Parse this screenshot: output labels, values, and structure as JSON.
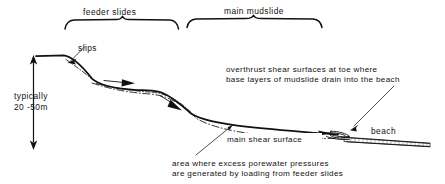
{
  "figure": {
    "title_top_left": "feeder slides",
    "title_top_right": "main mudslide",
    "scale_label_line1": "typically",
    "scale_label_line2": "20 -50m",
    "label_slips": "slips",
    "label_beach": "beach",
    "label_main_shear_surface": "main shear surface",
    "annotation_overthrust_line1": "overthrust shear surfaces at toe where",
    "annotation_overthrust_line2": "base layers of mudslide drain into the beach",
    "annotation_porewater_line1": "area where excess porewater pressures",
    "annotation_porewater_line2": "are generated by loading from feeder slides"
  },
  "colors": {
    "ink": "#111111",
    "paper": "#ffffff"
  },
  "icons": {
    "scale_arrow": "double-headed-vertical-arrow-icon",
    "flow_arrow": "downslope-flow-arrow-icon",
    "brace": "curly-brace-icon",
    "leader": "leader-line-icon"
  }
}
